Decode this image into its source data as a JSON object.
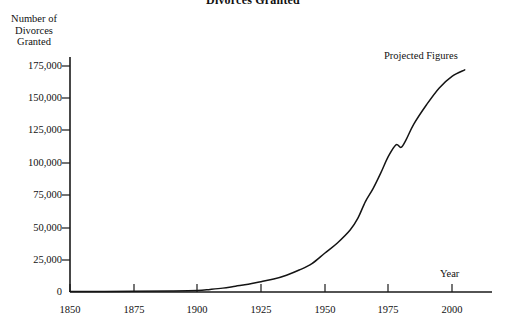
{
  "chart_data": {
    "type": "line",
    "title": "Divorces Granted",
    "xlabel": "Year",
    "ylabel": "Number of Divorces Granted",
    "ylabel_lines": [
      "Number of",
      "Divorces",
      "Granted"
    ],
    "xlim": [
      1850,
      2010
    ],
    "ylim": [
      0,
      185000
    ],
    "grid": false,
    "legend": null,
    "xticks": [
      1850,
      1875,
      1900,
      1925,
      1950,
      1975,
      2000
    ],
    "xtick_labels": [
      "1850",
      "1875",
      "1900",
      "1925",
      "1950",
      "1975",
      "2000"
    ],
    "yticks": [
      0,
      25000,
      50000,
      75000,
      100000,
      125000,
      150000,
      175000
    ],
    "ytick_labels": [
      "0",
      "25,000",
      "50,000",
      "75,000",
      "100,000",
      "125,000",
      "150,000",
      "175,000"
    ],
    "annotations": [
      {
        "text": "Projected Figures",
        "x": 1985,
        "y": 178000
      }
    ],
    "series": [
      {
        "name": "Divorces Granted",
        "color": "#141414",
        "x": [
          1850,
          1875,
          1890,
          1900,
          1905,
          1910,
          1915,
          1920,
          1925,
          1930,
          1935,
          1940,
          1945,
          1950,
          1955,
          1960,
          1963,
          1966,
          1969,
          1972,
          1975,
          1978,
          1980,
          1982,
          1985,
          1990,
          1995,
          2000,
          2005
        ],
        "y": [
          300,
          500,
          800,
          1200,
          2000,
          3000,
          4500,
          6000,
          8000,
          10000,
          13000,
          17000,
          22000,
          30000,
          38000,
          48000,
          57000,
          70000,
          80000,
          92000,
          105000,
          114000,
          112000,
          118000,
          130000,
          145000,
          158000,
          167000,
          172000
        ]
      }
    ]
  },
  "axis": {
    "y_title_lines": [
      "Number of",
      "Divorces",
      "Granted"
    ],
    "x_title": "Year"
  }
}
